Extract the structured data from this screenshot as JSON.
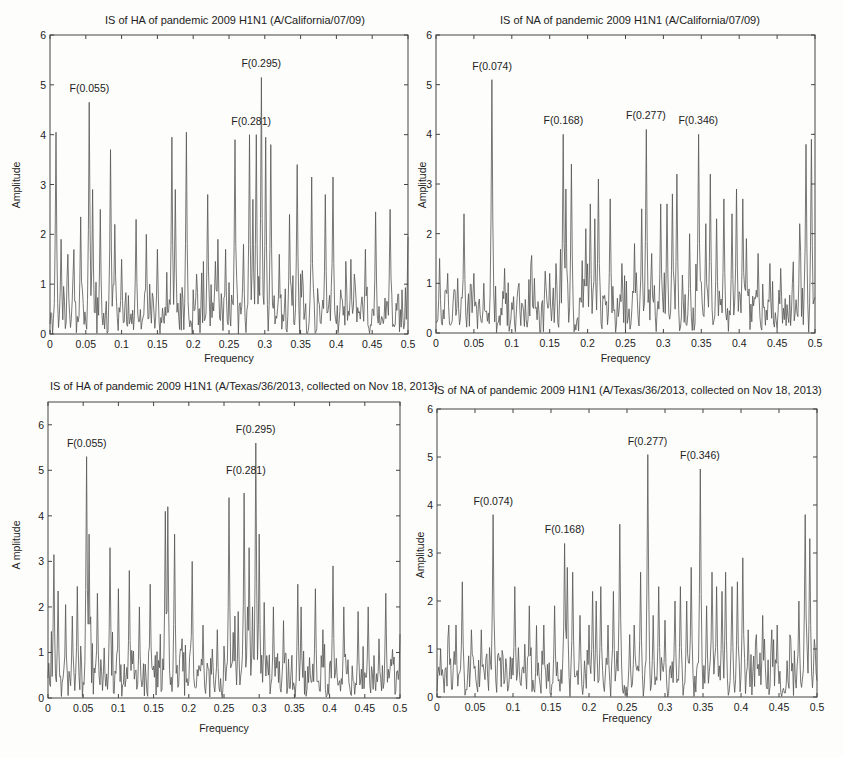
{
  "chart_data": [
    {
      "type": "line",
      "title": "IS of HA of pandemic 2009 H1N1 (A/California/07/09)",
      "xlabel": "Frequency",
      "ylabel": "Amplitude",
      "xlim": [
        0,
        0.5
      ],
      "ylim": [
        0,
        6
      ],
      "xticks": [
        "0",
        "0.05",
        "0.1",
        "0.15",
        "0.2",
        "0.25",
        "0.3",
        "0.35",
        "0.4",
        "0.45",
        "0.5"
      ],
      "yticks": [
        "0",
        "1",
        "2",
        "3",
        "4",
        "5",
        "6"
      ],
      "grid": false,
      "annotations": [
        {
          "text": "F(0.055)",
          "x": 0.055,
          "y": 4.65
        },
        {
          "text": "F(0.281)",
          "x": 0.281,
          "y": 4.0
        },
        {
          "text": "F(0.295)",
          "x": 0.295,
          "y": 5.15
        }
      ],
      "peaks": [
        [
          0.008,
          4.05
        ],
        [
          0.015,
          1.9
        ],
        [
          0.025,
          1.6
        ],
        [
          0.033,
          1.45
        ],
        [
          0.043,
          2.35
        ],
        [
          0.055,
          4.65
        ],
        [
          0.06,
          2.9
        ],
        [
          0.07,
          2.5
        ],
        [
          0.085,
          3.7
        ],
        [
          0.09,
          2.2
        ],
        [
          0.1,
          1.5
        ],
        [
          0.12,
          2.3
        ],
        [
          0.135,
          2.0
        ],
        [
          0.15,
          1.7
        ],
        [
          0.17,
          3.95
        ],
        [
          0.175,
          2.9
        ],
        [
          0.19,
          4.05
        ],
        [
          0.205,
          1.2
        ],
        [
          0.22,
          2.8
        ],
        [
          0.235,
          1.9
        ],
        [
          0.245,
          1.7
        ],
        [
          0.258,
          3.9
        ],
        [
          0.27,
          1.8
        ],
        [
          0.278,
          4.0
        ],
        [
          0.283,
          2.7
        ],
        [
          0.288,
          4.0
        ],
        [
          0.295,
          5.15
        ],
        [
          0.301,
          3.95
        ],
        [
          0.308,
          3.8
        ],
        [
          0.32,
          1.6
        ],
        [
          0.335,
          2.4
        ],
        [
          0.345,
          3.4
        ],
        [
          0.365,
          3.15
        ],
        [
          0.385,
          2.8
        ],
        [
          0.395,
          3.15
        ],
        [
          0.42,
          1.5
        ],
        [
          0.425,
          1.2
        ],
        [
          0.44,
          1.7
        ],
        [
          0.455,
          2.45
        ],
        [
          0.475,
          2.5
        ],
        [
          0.5,
          1.95
        ]
      ]
    },
    {
      "type": "line",
      "title": "IS of NA of pandemic 2009 H1N1 (A/California/07/09)",
      "xlabel": "Frequency",
      "ylabel": "Amplitude",
      "xlim": [
        0,
        0.5
      ],
      "ylim": [
        0,
        6
      ],
      "xticks": [
        "0",
        "0.05",
        "0.1",
        "0.15",
        "0.2",
        "0.25",
        "0.3",
        "0.35",
        "0.4",
        "0.45",
        "0.5"
      ],
      "yticks": [
        "0",
        "1",
        "2",
        "3",
        "4",
        "5",
        "6"
      ],
      "grid": false,
      "annotations": [
        {
          "text": "F(0.074)",
          "x": 0.074,
          "y": 5.1
        },
        {
          "text": "F(0.168)",
          "x": 0.168,
          "y": 4.0
        },
        {
          "text": "F(0.277)",
          "x": 0.277,
          "y": 4.1
        },
        {
          "text": "F(0.346)",
          "x": 0.346,
          "y": 4.0
        }
      ],
      "peaks": [
        [
          0.005,
          1.5
        ],
        [
          0.015,
          1.2
        ],
        [
          0.028,
          1.1
        ],
        [
          0.037,
          2.4
        ],
        [
          0.05,
          1.2
        ],
        [
          0.063,
          1.0
        ],
        [
          0.074,
          5.1
        ],
        [
          0.09,
          1.3
        ],
        [
          0.11,
          1.0
        ],
        [
          0.13,
          1.1
        ],
        [
          0.15,
          1.2
        ],
        [
          0.158,
          1.4
        ],
        [
          0.168,
          4.0
        ],
        [
          0.172,
          2.9
        ],
        [
          0.178,
          3.4
        ],
        [
          0.198,
          2.1
        ],
        [
          0.203,
          2.6
        ],
        [
          0.21,
          2.3
        ],
        [
          0.214,
          3.1
        ],
        [
          0.23,
          2.7
        ],
        [
          0.245,
          1.4
        ],
        [
          0.262,
          1.8
        ],
        [
          0.272,
          2.5
        ],
        [
          0.277,
          4.1
        ],
        [
          0.285,
          1.6
        ],
        [
          0.296,
          2.6
        ],
        [
          0.305,
          2.6
        ],
        [
          0.312,
          2.8
        ],
        [
          0.318,
          3.2
        ],
        [
          0.335,
          2.0
        ],
        [
          0.346,
          4.0
        ],
        [
          0.356,
          2.2
        ],
        [
          0.362,
          3.2
        ],
        [
          0.37,
          2.3
        ],
        [
          0.38,
          2.7
        ],
        [
          0.39,
          2.4
        ],
        [
          0.396,
          2.9
        ],
        [
          0.405,
          2.7
        ],
        [
          0.41,
          1.9
        ],
        [
          0.425,
          1.6
        ],
        [
          0.44,
          1.4
        ],
        [
          0.455,
          1.3
        ],
        [
          0.47,
          1.0
        ],
        [
          0.48,
          2.2
        ],
        [
          0.488,
          3.8
        ],
        [
          0.495,
          3.9
        ]
      ]
    },
    {
      "type": "line",
      "title": "IS of HA of pandemic 2009 H1N1  (A/Texas/36/2013, collected on Nov 18, 2013)",
      "xlabel": "Frequency",
      "ylabel": "A mplitude",
      "xlim": [
        0,
        0.5
      ],
      "ylim": [
        0,
        6.5
      ],
      "xticks": [
        "0",
        "0.05",
        "0.1",
        "0.15",
        "0.2",
        "0.25",
        "0.3",
        "0.35",
        "0.4",
        "0.45",
        "0.5"
      ],
      "yticks": [
        "0",
        "1",
        "2",
        "3",
        "4",
        "5",
        "6"
      ],
      "grid": false,
      "annotations": [
        {
          "text": "F(0.055)",
          "x": 0.055,
          "y": 5.3
        },
        {
          "text": "F(0.281)",
          "x": 0.281,
          "y": 4.7
        },
        {
          "text": "F(0.295)",
          "x": 0.295,
          "y": 5.6
        }
      ],
      "peaks": [
        [
          0.008,
          3.15
        ],
        [
          0.014,
          2.35
        ],
        [
          0.025,
          2.05
        ],
        [
          0.035,
          1.8
        ],
        [
          0.042,
          2.45
        ],
        [
          0.055,
          5.3
        ],
        [
          0.058,
          3.6
        ],
        [
          0.07,
          2.3
        ],
        [
          0.08,
          1.1
        ],
        [
          0.088,
          3.3
        ],
        [
          0.1,
          2.4
        ],
        [
          0.115,
          2.8
        ],
        [
          0.13,
          2.0
        ],
        [
          0.145,
          2.5
        ],
        [
          0.167,
          4.1
        ],
        [
          0.17,
          4.2
        ],
        [
          0.18,
          3.6
        ],
        [
          0.19,
          1.3
        ],
        [
          0.205,
          3.0
        ],
        [
          0.22,
          1.6
        ],
        [
          0.24,
          1.5
        ],
        [
          0.257,
          4.4
        ],
        [
          0.265,
          1.8
        ],
        [
          0.27,
          1.9
        ],
        [
          0.279,
          4.5
        ],
        [
          0.283,
          2.0
        ],
        [
          0.286,
          3.3
        ],
        [
          0.29,
          2.0
        ],
        [
          0.295,
          5.6
        ],
        [
          0.3,
          3.6
        ],
        [
          0.307,
          2.1
        ],
        [
          0.32,
          2.0
        ],
        [
          0.335,
          1.7
        ],
        [
          0.355,
          2.5
        ],
        [
          0.36,
          2.0
        ],
        [
          0.38,
          2.4
        ],
        [
          0.39,
          1.5
        ],
        [
          0.405,
          2.9
        ],
        [
          0.42,
          2.0
        ],
        [
          0.44,
          1.9
        ],
        [
          0.455,
          2.0
        ],
        [
          0.47,
          1.3
        ],
        [
          0.48,
          2.3
        ],
        [
          0.5,
          1.4
        ]
      ]
    },
    {
      "type": "line",
      "title": "IS of NA of pandemic 2009 H1N1 (A/Texas/36/2013, collected on Nov 18, 2013)",
      "xlabel": "Frequency",
      "ylabel": "Amplitude",
      "xlim": [
        0,
        0.5
      ],
      "ylim": [
        0,
        6
      ],
      "xticks": [
        "0",
        "0.05",
        "0.1",
        "0.15",
        "0.2",
        "0.25",
        "0.3",
        "0.35",
        "0.4",
        "0.45",
        "0.5"
      ],
      "yticks": [
        "0",
        "1",
        "2",
        "3",
        "4",
        "5",
        "6"
      ],
      "grid": false,
      "annotations": [
        {
          "text": "F(0.074)",
          "x": 0.074,
          "y": 3.8
        },
        {
          "text": "F(0.168)",
          "x": 0.168,
          "y": 3.2
        },
        {
          "text": "F(0.277)",
          "x": 0.277,
          "y": 5.05
        },
        {
          "text": "F(0.346)",
          "x": 0.346,
          "y": 4.75
        }
      ],
      "peaks": [
        [
          0.005,
          1.0
        ],
        [
          0.015,
          1.5
        ],
        [
          0.025,
          1.5
        ],
        [
          0.033,
          2.4
        ],
        [
          0.045,
          1.4
        ],
        [
          0.058,
          1.4
        ],
        [
          0.065,
          0.9
        ],
        [
          0.074,
          3.8
        ],
        [
          0.09,
          0.8
        ],
        [
          0.102,
          2.3
        ],
        [
          0.115,
          1.1
        ],
        [
          0.122,
          1.9
        ],
        [
          0.14,
          1.5
        ],
        [
          0.155,
          1.9
        ],
        [
          0.168,
          3.2
        ],
        [
          0.172,
          2.7
        ],
        [
          0.178,
          2.6
        ],
        [
          0.188,
          1.7
        ],
        [
          0.2,
          1.5
        ],
        [
          0.205,
          2.2
        ],
        [
          0.21,
          2.0
        ],
        [
          0.215,
          2.3
        ],
        [
          0.225,
          1.5
        ],
        [
          0.232,
          2.2
        ],
        [
          0.24,
          3.6
        ],
        [
          0.253,
          1.3
        ],
        [
          0.26,
          1.5
        ],
        [
          0.268,
          2.6
        ],
        [
          0.277,
          5.05
        ],
        [
          0.285,
          1.7
        ],
        [
          0.292,
          2.3
        ],
        [
          0.3,
          1.6
        ],
        [
          0.313,
          2.0
        ],
        [
          0.32,
          2.3
        ],
        [
          0.328,
          2.0
        ],
        [
          0.335,
          2.7
        ],
        [
          0.346,
          4.75
        ],
        [
          0.355,
          1.9
        ],
        [
          0.362,
          2.6
        ],
        [
          0.368,
          2.3
        ],
        [
          0.375,
          2.2
        ],
        [
          0.38,
          2.6
        ],
        [
          0.388,
          2.3
        ],
        [
          0.395,
          2.4
        ],
        [
          0.402,
          2.9
        ],
        [
          0.41,
          1.4
        ],
        [
          0.42,
          1.3
        ],
        [
          0.428,
          1.7
        ],
        [
          0.44,
          1.4
        ],
        [
          0.448,
          1.5
        ],
        [
          0.465,
          1.2
        ],
        [
          0.476,
          2.0
        ],
        [
          0.485,
          3.8
        ],
        [
          0.49,
          3.3
        ],
        [
          0.497,
          1.2
        ]
      ]
    }
  ]
}
